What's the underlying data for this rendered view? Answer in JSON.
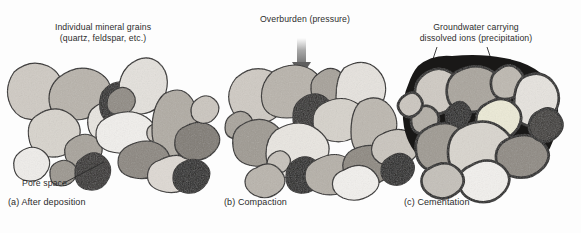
{
  "figure": {
    "background": "#fdfdfd",
    "ink": "#2b2b2b",
    "type": "lithification-stages-diagram",
    "title_a": "Individual mineral grains\n(quartz, feldspar, etc.)",
    "title_b": "Overburden (pressure)",
    "title_c": "Groundwater carrying\ndissolved ions (precipitation)",
    "pore_label": "Pore space",
    "caption_a": "(a) After deposition",
    "caption_b": "(b) Compaction",
    "caption_c": "(c) Cementation"
  },
  "diagram_data": {
    "type": "schematic",
    "panels": [
      {
        "id": "a",
        "caption": "(a) After deposition",
        "annotation": "Individual mineral grains (quartz, feldspar, etc.)",
        "callout": "Pore space",
        "description": "Loosely packed rounded sediment grains with large open white pore spaces between them",
        "packing": "loose",
        "cement": "none",
        "pore_visibility": "high"
      },
      {
        "id": "b",
        "caption": "(b) Compaction",
        "annotation": "Overburden (pressure)",
        "description": "Grains squeezed tightly together by downward overburden pressure; pore space greatly reduced",
        "packing": "tight",
        "cement": "none",
        "pore_visibility": "low",
        "arrow": "downward-pressure-arrow"
      },
      {
        "id": "c",
        "caption": "(c) Cementation",
        "annotation": "Groundwater carrying dissolved ions (precipitation)",
        "description": "Grains bound together by dark cement precipitated from groundwater filling remaining pore space",
        "packing": "tight",
        "cement": "dark-precipitated-cement",
        "pore_visibility": "none",
        "arrows": [
          "groundwater-inflow-left",
          "groundwater-inflow-right"
        ]
      }
    ],
    "grain_palette": [
      "#ffffff",
      "#f2f0ec",
      "#dcd8d2",
      "#c4c0b9",
      "#a9a49c",
      "#8e8982",
      "#6f6b65",
      "#3a3734",
      "#1b1a19"
    ],
    "outline_color": "#1f1d1c",
    "cement_color": "#191817"
  }
}
